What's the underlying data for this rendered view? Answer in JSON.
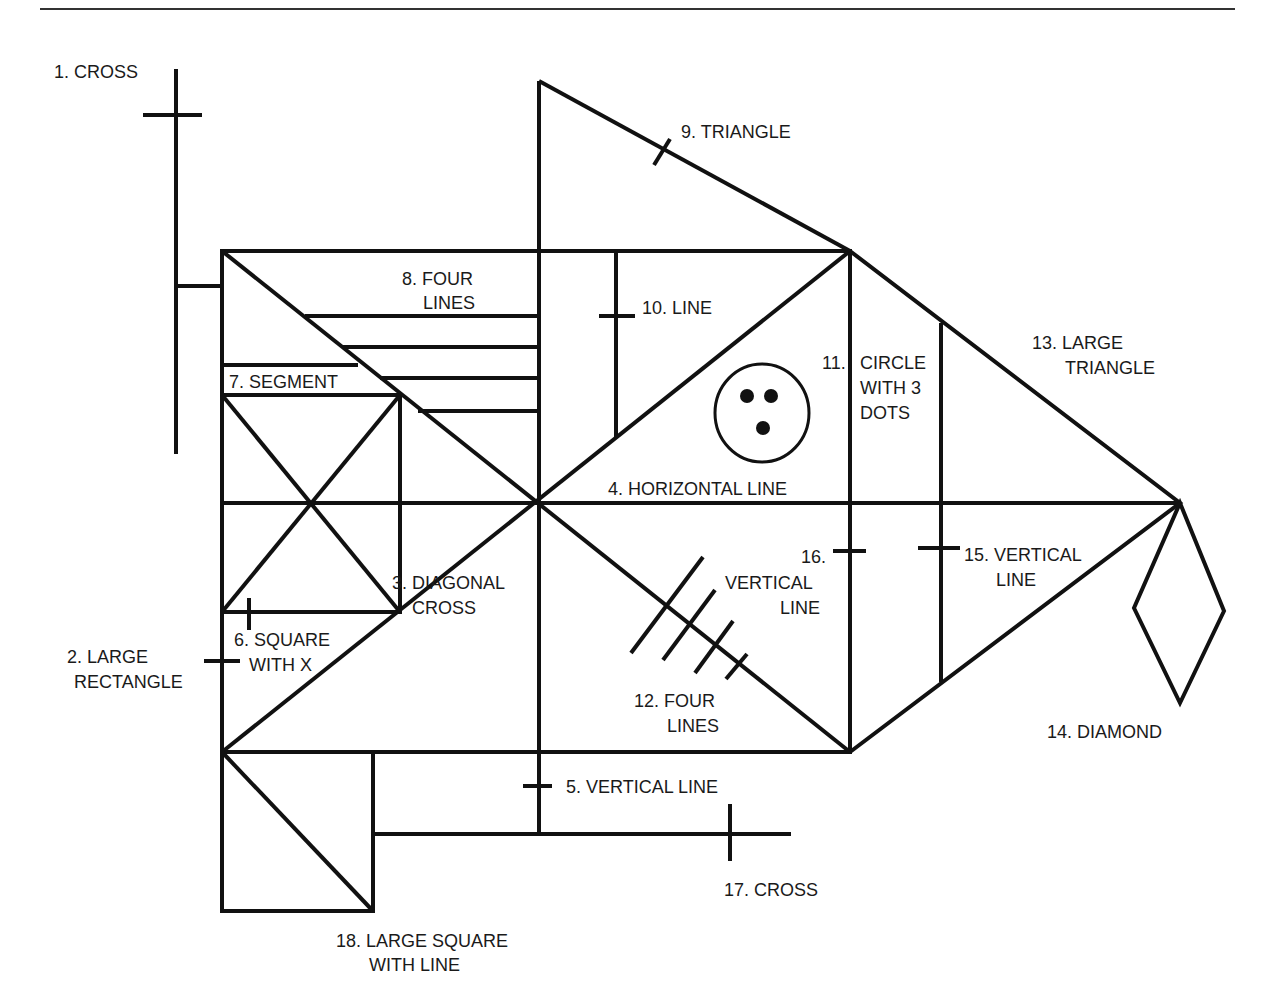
{
  "figure": {
    "stroke_color": "#111111",
    "background": "#ffffff"
  },
  "labels": {
    "l1": "1. CROSS",
    "l2a": "2. LARGE",
    "l2b": "RECTANGLE",
    "l3a": "3. DIAGONAL",
    "l3b": "CROSS",
    "l4": "4. HORIZONTAL LINE",
    "l5": "5. VERTICAL LINE",
    "l6a": "6. SQUARE",
    "l6b": "WITH X",
    "l7": "7. SEGMENT",
    "l8a": "8. FOUR",
    "l8b": "LINES",
    "l9": "9. TRIANGLE",
    "l10": "10. LINE",
    "l11a": "11.",
    "l11b": "CIRCLE",
    "l11c": "WITH 3",
    "l11d": "DOTS",
    "l12a": "12. FOUR",
    "l12b": "LINES",
    "l13a": "13. LARGE",
    "l13b": "TRIANGLE",
    "l14": "14. DIAMOND",
    "l15a": "15. VERTICAL",
    "l15b": "LINE",
    "l16a": "16.",
    "l16b": "VERTICAL",
    "l16c": "LINE",
    "l17": "17. CROSS",
    "l18a": "18. LARGE SQUARE",
    "l18b": "WITH LINE"
  }
}
